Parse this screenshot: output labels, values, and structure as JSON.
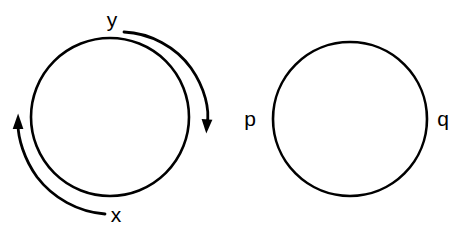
{
  "figure": {
    "background_color": "#ffffff",
    "stroke_color": "#000000",
    "title": "",
    "shapes": [
      {
        "name": "left-circle",
        "type": "circle",
        "cx": 110,
        "cy": 117,
        "r": 79,
        "stroke_width": 2.6
      },
      {
        "name": "right-circle",
        "type": "circle",
        "cx": 350,
        "cy": 119,
        "r": 77,
        "stroke_width": 2.6
      }
    ],
    "arrows": [
      {
        "name": "clockwise-arrow",
        "from_label": "y",
        "direction": "clockwise",
        "head_position": "right",
        "stroke_width": 2.8
      },
      {
        "name": "counterclockwise-arrow",
        "from_label": "x",
        "direction": "counterclockwise",
        "head_position": "left",
        "stroke_width": 2.8
      }
    ],
    "labels": {
      "y": "y",
      "x": "x",
      "p": "p",
      "q": "q"
    },
    "label_positions": {
      "y": {
        "x": 112,
        "y": 21
      },
      "x": {
        "x": 116,
        "y": 216
      },
      "p": {
        "x": 250,
        "y": 120
      },
      "q": {
        "x": 443,
        "y": 120
      }
    }
  }
}
